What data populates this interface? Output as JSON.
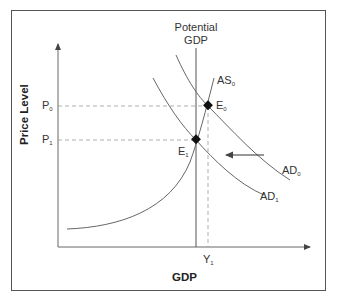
{
  "diagram": {
    "title_line1": "Potential",
    "title_line2": "GDP",
    "y_axis_label": "Price Level",
    "x_axis_label": "GDP",
    "price_labels": [
      {
        "main": "P",
        "sub": "0"
      },
      {
        "main": "P",
        "sub": "1"
      }
    ],
    "quantity_labels": [
      {
        "main": "Y",
        "sub": "1"
      }
    ],
    "curves": [
      {
        "main": "AS",
        "sub": "0",
        "type": "aggregate-supply"
      },
      {
        "main": "AD",
        "sub": "0",
        "type": "aggregate-demand"
      },
      {
        "main": "AD",
        "sub": "1",
        "type": "aggregate-demand"
      }
    ],
    "equilibria": [
      {
        "main": "E",
        "sub": "0"
      },
      {
        "main": "E",
        "sub": "1"
      }
    ],
    "shift_arrow": "left",
    "colors": {
      "curve": "#555555",
      "dashed": "#888888",
      "point": "#111111",
      "frame": "#555555"
    }
  }
}
